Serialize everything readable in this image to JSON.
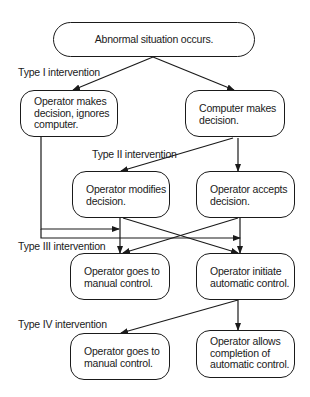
{
  "diagram": {
    "type": "flowchart",
    "nodes": {
      "start": {
        "lines": [
          "Abnormal situation occurs."
        ]
      },
      "op_ignores": {
        "lines": [
          "Operator makes",
          "decision, ignores",
          "computer."
        ]
      },
      "comp_decides": {
        "lines": [
          "Computer makes",
          "decision."
        ]
      },
      "op_modifies": {
        "lines": [
          "Operator modifies",
          "decision."
        ]
      },
      "op_accepts": {
        "lines": [
          "Operator accepts",
          "decision."
        ]
      },
      "op_manual_3": {
        "lines": [
          "Operator goes to",
          "manual control."
        ]
      },
      "op_auto_init": {
        "lines": [
          "Operator initiate",
          "automatic control."
        ]
      },
      "op_manual_4": {
        "lines": [
          "Operator goes to",
          "manual control."
        ]
      },
      "op_allows": {
        "lines": [
          "Operator allows",
          "completion of",
          "automatic control."
        ]
      }
    },
    "labels": {
      "type1": "Type I intervention",
      "type2": "Type II intervention",
      "type3": "Type III intervention",
      "type4": "Type IV intervention"
    },
    "edges": [
      {
        "from": "start",
        "to": "op_ignores"
      },
      {
        "from": "start",
        "to": "comp_decides"
      },
      {
        "from": "comp_decides",
        "to": "op_modifies"
      },
      {
        "from": "comp_decides",
        "to": "op_accepts"
      },
      {
        "from": "op_ignores",
        "to": "op_manual_3"
      },
      {
        "from": "op_ignores",
        "to": "op_auto_init"
      },
      {
        "from": "op_modifies",
        "to": "op_manual_3"
      },
      {
        "from": "op_modifies",
        "to": "op_auto_init"
      },
      {
        "from": "op_accepts",
        "to": "op_manual_3"
      },
      {
        "from": "op_accepts",
        "to": "op_auto_init"
      },
      {
        "from": "op_auto_init",
        "to": "op_manual_4"
      },
      {
        "from": "op_auto_init",
        "to": "op_allows"
      }
    ],
    "colors": {
      "stroke": "#1a1a1a",
      "background": "#ffffff"
    }
  }
}
